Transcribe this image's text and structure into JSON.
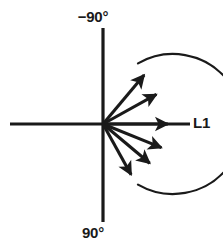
{
  "figure": {
    "name": "radiation-pattern-vector-diagram",
    "background_color": "#ffffff",
    "stroke_color": "#1a1a1a"
  },
  "labels": {
    "top": "−90°",
    "bottom": "90°",
    "right": "L1"
  },
  "geometry": {
    "origin": {
      "x": 103,
      "y": 124
    },
    "horizontal_axis": {
      "x1": 10,
      "y1": 124,
      "x2": 190,
      "y2": 124
    },
    "vertical_axis": {
      "x1": 103,
      "y1": 28,
      "x2": 103,
      "y2": 222
    },
    "arc": {
      "radius": 70,
      "start_angle_deg": -60,
      "end_angle_deg": 60,
      "start_point": {
        "x": 110,
        "y": 45
      },
      "end_point": {
        "x": 110,
        "y": 203
      }
    }
  },
  "chart_data": {
    "type": "scatter",
    "title": "",
    "xlabel": "",
    "ylabel": "",
    "annotations": [
      "−90°",
      "90°",
      "L1"
    ],
    "series": [
      {
        "name": "direction-vectors",
        "unit": "degrees",
        "note": "Angle measured from the horizontal L1 axis; negative is upward toward −90°, positive is downward toward 90°",
        "vectors": [
          {
            "id": "vector-up-steep",
            "angle_deg": -50,
            "length": 64
          },
          {
            "id": "vector-up-shallow",
            "angle_deg": -29,
            "length": 61
          },
          {
            "id": "vector-horizontal",
            "angle_deg": 0,
            "length": 65
          },
          {
            "id": "vector-down-shallow",
            "angle_deg": 22,
            "length": 63
          },
          {
            "id": "vector-down-mid",
            "angle_deg": 40,
            "length": 61
          },
          {
            "id": "vector-down-steep",
            "angle_deg": 61,
            "length": 58
          }
        ]
      }
    ]
  }
}
